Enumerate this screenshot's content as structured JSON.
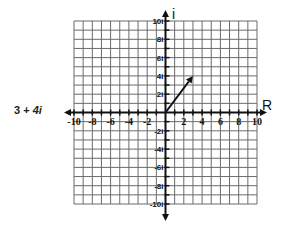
{
  "expression": {
    "real": "3",
    "operator": "+",
    "imaginary": "4i",
    "full": "3 + 4i"
  },
  "plane": {
    "horizontal_axis_label": "R",
    "vertical_axis_label": "i",
    "x_range": [
      -10,
      10
    ],
    "y_range": [
      -10,
      10
    ],
    "grid_step": 1,
    "x_tick_labels": [
      "-10",
      "-8",
      "-6",
      "-4",
      "-2",
      "2",
      "4",
      "6",
      "8",
      "10"
    ],
    "y_tick_labels": [
      "10i",
      "8i",
      "6i",
      "4i",
      "2i",
      "-2i",
      "-4i",
      "-6i",
      "-8i",
      "-10i"
    ],
    "vector": {
      "from": [
        0,
        0
      ],
      "to": [
        3,
        4
      ],
      "label": "3 + 4i"
    }
  },
  "colors": {
    "grid": "#6b6b6b",
    "axis": "#111111",
    "vector": "#111111",
    "background": "#ffffff"
  }
}
